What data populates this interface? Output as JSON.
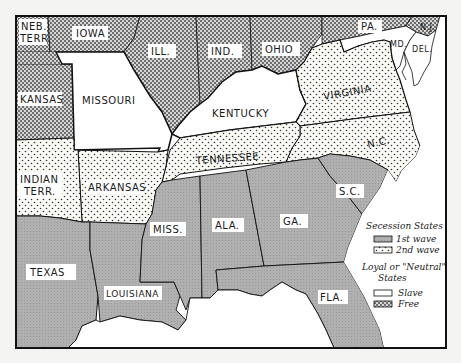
{
  "map": {
    "title": "Secession of Southern States",
    "colors": {
      "first_wave": "#a9a9a9",
      "second_wave": "#f1f1ee",
      "slave": "#ffffff",
      "free": "#9a9a9a",
      "water": "#ffffff",
      "border": "#111111"
    },
    "states": [
      {
        "id": "neb-terr",
        "label_line1": "NEB.",
        "label_line2": "TERR.",
        "category": "free"
      },
      {
        "id": "iowa",
        "label": "IOWA",
        "category": "free"
      },
      {
        "id": "ill",
        "label": "ILL.",
        "category": "free"
      },
      {
        "id": "ind",
        "label": "IND.",
        "category": "free"
      },
      {
        "id": "ohio",
        "label": "OHIO",
        "category": "free"
      },
      {
        "id": "pa",
        "label": "PA.",
        "category": "free"
      },
      {
        "id": "nj",
        "label": "N.J.",
        "category": "free"
      },
      {
        "id": "kansas",
        "label": "KANSAS",
        "category": "free"
      },
      {
        "id": "missouri",
        "label": "MISSOURI",
        "category": "slave"
      },
      {
        "id": "kentucky",
        "label": "KENTUCKY",
        "category": "slave"
      },
      {
        "id": "md",
        "label": "MD.",
        "category": "slave"
      },
      {
        "id": "del",
        "label": "DEL.",
        "category": "slave"
      },
      {
        "id": "virginia",
        "label": "VIRGINIA",
        "category": "second_wave"
      },
      {
        "id": "nc",
        "label": "N.C.",
        "category": "second_wave"
      },
      {
        "id": "tennessee",
        "label": "TENNESSEE",
        "category": "second_wave"
      },
      {
        "id": "arkansas",
        "label": "ARKANSAS",
        "category": "second_wave"
      },
      {
        "id": "indian-terr",
        "label_line1": "INDIAN",
        "label_line2": "TERR.",
        "category": "second_wave"
      },
      {
        "id": "texas",
        "label": "TEXAS",
        "category": "first_wave"
      },
      {
        "id": "louisiana",
        "label": "LOUISIANA",
        "category": "first_wave"
      },
      {
        "id": "miss",
        "label": "MISS.",
        "category": "first_wave"
      },
      {
        "id": "ala",
        "label": "ALA.",
        "category": "first_wave"
      },
      {
        "id": "ga",
        "label": "GA.",
        "category": "first_wave"
      },
      {
        "id": "sc",
        "label": "S.C.",
        "category": "first_wave"
      },
      {
        "id": "fla",
        "label": "FLA.",
        "category": "first_wave"
      }
    ],
    "legend": {
      "heading1": "Secession States",
      "item1": "1st wave",
      "item2": "2nd wave",
      "heading2_line1": "Loyal or \"Neutral\"",
      "heading2_line2": "States",
      "item3": "Slave",
      "item4": "Free"
    }
  }
}
